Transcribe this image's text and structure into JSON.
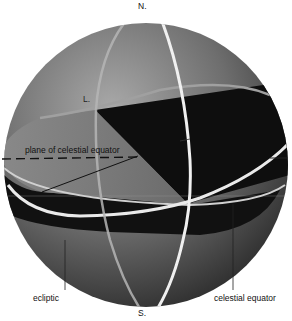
{
  "diagram": {
    "type": "celestial-sphere",
    "labels": {
      "north_pole": "N.",
      "south_pole": "S.",
      "point_l": "L.",
      "point_a": "A.",
      "plane": "plane of celestial equator",
      "ecliptic": "ecliptic",
      "celestial_equator": "celestial equator"
    },
    "colors": {
      "sphere_light": "#9a9a9a",
      "sphere_dark": "#3a3a3a",
      "shadow_region": "#0e0e0e",
      "plane_fill": "#7c7c7c",
      "great_circle": "#e6e6e6",
      "label_text": "#111111"
    }
  }
}
